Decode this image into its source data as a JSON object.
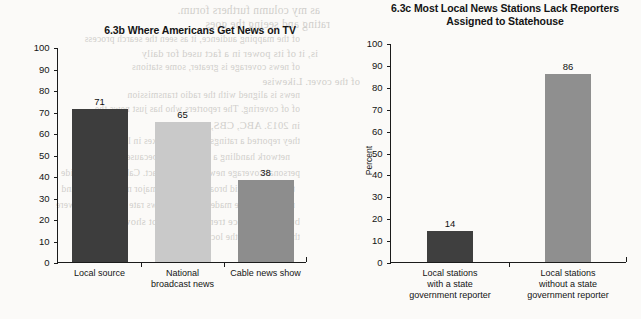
{
  "page": {
    "background_color": "#fbfaf8",
    "bleed_text": [
      "as my column furthers forum.",
      "rating and seeing the goes",
      "of the mapping audience, it as seen the search process",
      "is, it of its power in a fact used for daily",
      "of news coverage is greater, some stations",
      "of the cover. Likewise",
      "news is aligned with the radio transmission",
      "of of covering. The reporters who has just news the",
      "in 2013. ABC, CBS, and NBC",
      "they reported a ratings rate these boxes in lost with",
      "network handling a viewers, and because on basis",
      "personal coverage news to gain impact. Cable news provide",
      "the hours in mid broadcast for the major networks demand",
      "may have to be made, the cable news rate as years ago were",
      "but the audience trend of news not show",
      "the stations for the local coverage"
    ]
  },
  "charts": [
    {
      "id": "6.3b",
      "title": "6.3b Where Americans Get News on TV",
      "ylabel_lines": [
        "Percent using each television type for news",
        "in the past month (2013)"
      ]
    },
    {
      "id": "6.3c",
      "title": "6.3c Most Local News Stations Lack Reporters Assigned to Statehouse",
      "ylabel_lines": [
        "Percent"
      ]
    }
  ],
  "chart_data": [
    {
      "type": "bar",
      "title": "6.3b Where Americans Get News on TV",
      "xlabel": "",
      "ylabel": "Percent using each television type for news in the past month (2013)",
      "ylim": [
        0,
        100
      ],
      "yticks": [
        0,
        10,
        20,
        30,
        40,
        50,
        60,
        70,
        80,
        90,
        100
      ],
      "grid": false,
      "legend": "none",
      "categories": [
        "Local source",
        "National broadcast news",
        "Cable news show"
      ],
      "category_lines": [
        [
          "Local source"
        ],
        [
          "National",
          "broadcast news"
        ],
        [
          "Cable news show"
        ]
      ],
      "values": [
        71,
        65,
        38
      ],
      "bar_colors": [
        "#3d3d3d",
        "#c9c9c9",
        "#8d8d8d"
      ]
    },
    {
      "type": "bar",
      "title": "6.3c Most Local News Stations Lack Reporters Assigned to Statehouse",
      "title_lines": [
        "6.3c Most Local News Stations Lack Reporters",
        "Assigned to Statehouse"
      ],
      "xlabel": "",
      "ylabel": "Percent",
      "ylim": [
        0,
        100
      ],
      "yticks": [
        0,
        10,
        20,
        30,
        40,
        50,
        60,
        70,
        80,
        90,
        100
      ],
      "grid": false,
      "legend": "none",
      "categories": [
        "Local stations with a state government reporter",
        "Local stations without a state government reporter"
      ],
      "category_lines": [
        [
          "Local stations",
          "with a state",
          "government reporter"
        ],
        [
          "Local stations",
          "without a state",
          "government reporter"
        ]
      ],
      "values": [
        14,
        86
      ],
      "bar_colors": [
        "#3f3f3f",
        "#8f8f8f"
      ]
    }
  ]
}
